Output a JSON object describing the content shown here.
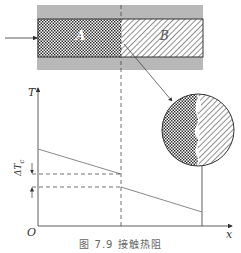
{
  "figure": {
    "caption": "图 7.9  接触热阻",
    "material_a_label": "A",
    "material_b_label": "B",
    "y_axis_label": "T",
    "x_axis_label": "x",
    "origin_label": "O",
    "delta_label": "ΔT",
    "delta_subscript": "c"
  },
  "colors": {
    "ink": "#333333",
    "insulation_gray": "#b5b5b5",
    "line_gray": "#888888"
  }
}
